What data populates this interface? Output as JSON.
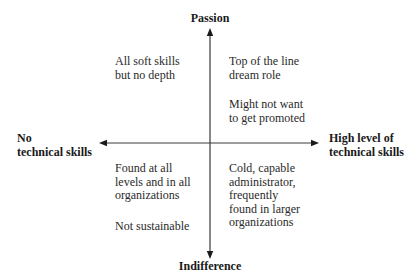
{
  "axes": {
    "vertical": {
      "top_label": "Passion",
      "bottom_label": "Indifference"
    },
    "horizontal": {
      "left_label": [
        "No",
        "technical skills"
      ],
      "right_label": [
        "High level of",
        "technical skills"
      ]
    },
    "line_color": "#3a3a3a"
  },
  "quadrants": {
    "top_left": {
      "blocks": [
        [
          "All soft skills",
          "but no depth"
        ]
      ]
    },
    "top_right": {
      "blocks": [
        [
          "Top of the line",
          "dream role"
        ],
        [
          "Might not want",
          "to get promoted"
        ]
      ]
    },
    "bottom_left": {
      "blocks": [
        [
          "Found at all",
          "levels and in all",
          "organizations"
        ],
        [
          "Not sustainable"
        ]
      ]
    },
    "bottom_right": {
      "blocks": [
        [
          "Cold, capable",
          "administrator,",
          "frequently",
          "found in larger",
          "organizations"
        ]
      ]
    }
  }
}
